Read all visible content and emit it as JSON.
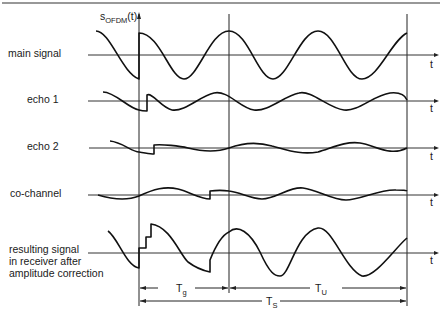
{
  "figure": {
    "y_axis_label": "s",
    "y_axis_subscript": "OFDM",
    "y_axis_suffix": "(t)",
    "time_axis_label": "t",
    "rows": [
      {
        "id": "main",
        "label_lines": [
          "main signal"
        ]
      },
      {
        "id": "echo1",
        "label_lines": [
          "echo 1"
        ]
      },
      {
        "id": "echo2",
        "label_lines": [
          "echo 2"
        ]
      },
      {
        "id": "cochannel",
        "label_lines": [
          "co-channel"
        ]
      },
      {
        "id": "result",
        "label_lines": [
          "resulting signal",
          "in receiver after",
          "amplitude correction"
        ]
      }
    ],
    "intervals": {
      "guard": {
        "label": "T",
        "sub": "g"
      },
      "useful": {
        "label": "T",
        "sub": "U"
      },
      "symbol": {
        "label": "T",
        "sub": "S"
      }
    }
  }
}
